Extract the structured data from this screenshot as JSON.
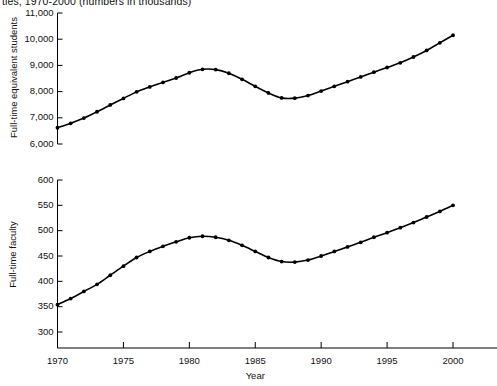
{
  "chart_title": "ties, 1970-2000 (numbers in thousands)",
  "axis_titles": {
    "top_y": "Full-time equivalent students",
    "bottom_y": "Full-time faculty",
    "x": "Year"
  },
  "top_panel": {
    "y_ticks": [
      "11,000",
      "10,000",
      "9,000",
      "8,000",
      "7,000",
      "6,000"
    ]
  },
  "bottom_panel": {
    "y_ticks": [
      "600",
      "550",
      "500",
      "450",
      "400",
      "350",
      "300"
    ]
  },
  "x_ticks": [
    "1970",
    "1975",
    "1980",
    "1985",
    "1990",
    "1995",
    "2000"
  ],
  "colors": {
    "line": "#000000",
    "marker": "#000000",
    "axis": "#000000",
    "background": "#ffffff"
  },
  "chart_data": [
    {
      "type": "line",
      "title": "ties, 1970-2000 (numbers in thousands)",
      "xlabel": "Year",
      "ylabel": "Full-time equivalent students",
      "xlim": [
        1970,
        2000
      ],
      "ylim": [
        6000,
        11000
      ],
      "ytick_values": [
        6000,
        7000,
        8000,
        9000,
        10000,
        11000
      ],
      "xtick_values": [
        1970,
        1975,
        1980,
        1985,
        1990,
        1995,
        2000
      ],
      "grid": false,
      "legend": "none",
      "markers": "filled-circle",
      "x": [
        1970,
        1971,
        1972,
        1973,
        1974,
        1975,
        1976,
        1977,
        1978,
        1979,
        1980,
        1981,
        1982,
        1983,
        1984,
        1985,
        1986,
        1987,
        1988,
        1989,
        1990,
        1991,
        1992,
        1993,
        1994,
        1995,
        1996,
        1997,
        1998,
        1999,
        2000
      ],
      "values": [
        6620,
        6790,
        6990,
        7230,
        7490,
        7740,
        7990,
        8180,
        8350,
        8520,
        8720,
        8850,
        8840,
        8700,
        8470,
        8200,
        7950,
        7760,
        7750,
        7850,
        8020,
        8200,
        8380,
        8560,
        8740,
        8920,
        9100,
        9320,
        9570,
        9860,
        10150
      ]
    },
    {
      "type": "line",
      "xlabel": "Year",
      "ylabel": "Full-time faculty",
      "xlim": [
        1970,
        2000
      ],
      "ylim": [
        300,
        600
      ],
      "ytick_values": [
        300,
        350,
        400,
        450,
        500,
        550,
        600
      ],
      "xtick_values": [
        1970,
        1975,
        1980,
        1985,
        1990,
        1995,
        2000
      ],
      "grid": false,
      "legend": "none",
      "markers": "filled-circle",
      "x": [
        1970,
        1971,
        1972,
        1973,
        1974,
        1975,
        1976,
        1977,
        1978,
        1979,
        1980,
        1981,
        1982,
        1983,
        1984,
        1985,
        1986,
        1987,
        1988,
        1989,
        1990,
        1991,
        1992,
        1993,
        1994,
        1995,
        1996,
        1997,
        1998,
        1999,
        2000
      ],
      "values": [
        354,
        366,
        380,
        394,
        412,
        430,
        447,
        459,
        469,
        478,
        486,
        489,
        487,
        481,
        471,
        459,
        447,
        439,
        438,
        442,
        450,
        459,
        468,
        477,
        487,
        496,
        506,
        516,
        527,
        538,
        550
      ]
    }
  ]
}
